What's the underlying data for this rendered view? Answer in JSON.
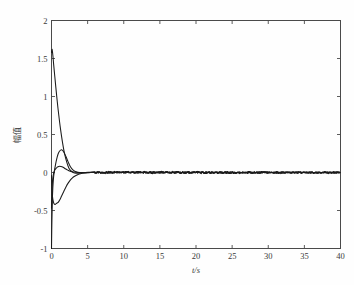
{
  "chart_data": {
    "type": "line",
    "title": "",
    "xlabel": "t/s",
    "ylabel": "幅值",
    "xlim": [
      0,
      40
    ],
    "ylim": [
      -1,
      2
    ],
    "xticks": [
      0,
      5,
      10,
      15,
      20,
      25,
      30,
      35,
      40
    ],
    "xticklabels": [
      "0",
      "5",
      "10",
      "15",
      "20",
      "25",
      "30",
      "35",
      "40"
    ],
    "yticks": [
      -1,
      -0.5,
      0,
      0.5,
      1,
      1.5,
      2
    ],
    "yticklabels": [
      "-1",
      "-0.5",
      "0",
      "0.5",
      "1",
      "1.5",
      "2"
    ],
    "grid": false,
    "legend": null,
    "line_color": "#1a1a1a",
    "background_color": "#fefefe",
    "axis_color": "#4a4a4a",
    "series": [
      {
        "name": "state-1",
        "comment": "starts near 1.6, decays steeply through zero by t~2.6, settles at 0 with small noise",
        "x": [
          0.0,
          0.08,
          0.18,
          0.3,
          0.45,
          0.6,
          0.8,
          1.0,
          1.25,
          1.5,
          1.8,
          2.1,
          2.4,
          2.7,
          3.0,
          3.4,
          3.8,
          4.3,
          5.0,
          6.0,
          8.0,
          10.0,
          12.0,
          15.0,
          18.0,
          21.0,
          24.0,
          27.0,
          30.0,
          33.0,
          36.0,
          38.0,
          40.0
        ],
        "y": [
          1.58,
          1.62,
          1.55,
          1.42,
          1.27,
          1.12,
          0.93,
          0.76,
          0.57,
          0.41,
          0.25,
          0.14,
          0.06,
          0.02,
          0.0,
          -0.01,
          -0.01,
          -0.005,
          0.0,
          0.004,
          -0.006,
          0.005,
          -0.004,
          0.006,
          -0.005,
          0.004,
          -0.006,
          0.005,
          -0.004,
          0.005,
          -0.005,
          0.004,
          0.0
        ]
      },
      {
        "name": "state-2",
        "comment": "starts at -1, rises quickly, overshoots to about +0.30 at t~1.4, returns to 0 by t~3.5",
        "x": [
          0.0,
          0.06,
          0.14,
          0.25,
          0.4,
          0.55,
          0.7,
          0.9,
          1.1,
          1.4,
          1.7,
          2.0,
          2.3,
          2.6,
          3.0,
          3.4,
          3.9,
          4.5,
          5.2,
          6.0,
          8.0,
          10.0,
          13.0,
          16.0,
          19.0,
          22.0,
          25.0,
          28.0,
          31.0,
          34.0,
          37.0,
          40.0
        ],
        "y": [
          -1.0,
          -0.62,
          -0.3,
          -0.1,
          0.02,
          0.1,
          0.17,
          0.24,
          0.28,
          0.3,
          0.27,
          0.21,
          0.14,
          0.08,
          0.03,
          0.01,
          0.0,
          0.0,
          -0.003,
          0.004,
          -0.005,
          0.006,
          -0.004,
          0.005,
          -0.006,
          0.004,
          -0.005,
          0.005,
          -0.004,
          0.005,
          -0.004,
          0.0
        ]
      },
      {
        "name": "state-3",
        "comment": "starts near -0.05, dips down to about -0.42 at t~0.9, recovers to 0 by t~4",
        "x": [
          0.0,
          0.05,
          0.12,
          0.22,
          0.35,
          0.5,
          0.65,
          0.8,
          0.95,
          1.15,
          1.4,
          1.7,
          2.0,
          2.3,
          2.6,
          2.9,
          3.2,
          3.6,
          4.0,
          4.6,
          5.4,
          6.5,
          8.0,
          10.0,
          13.0,
          16.0,
          19.0,
          22.0,
          25.0,
          28.0,
          31.0,
          34.0,
          37.0,
          40.0
        ],
        "y": [
          -0.04,
          -0.18,
          -0.3,
          -0.37,
          -0.41,
          -0.42,
          -0.41,
          -0.4,
          -0.39,
          -0.36,
          -0.31,
          -0.25,
          -0.19,
          -0.14,
          -0.1,
          -0.07,
          -0.05,
          -0.03,
          -0.015,
          -0.006,
          0.0,
          0.004,
          -0.005,
          0.005,
          -0.004,
          0.006,
          -0.005,
          0.004,
          -0.005,
          0.005,
          -0.004,
          0.004,
          -0.005,
          0.0
        ]
      },
      {
        "name": "state-4",
        "comment": "starts near -0.45, quick rise through 0, small bump, settles flat at 0",
        "x": [
          0.0,
          0.05,
          0.12,
          0.2,
          0.32,
          0.45,
          0.6,
          0.8,
          1.0,
          1.3,
          1.6,
          1.9,
          2.2,
          2.5,
          2.9,
          3.3,
          3.8,
          4.4,
          5.2,
          6.2,
          8.0,
          10.0,
          12.0,
          15.0,
          18.0,
          21.0,
          24.0,
          27.0,
          30.0,
          33.0,
          36.0,
          38.0,
          40.0
        ],
        "y": [
          -0.47,
          -0.28,
          -0.14,
          -0.06,
          0.0,
          0.03,
          0.05,
          0.07,
          0.08,
          0.08,
          0.07,
          0.05,
          0.035,
          0.02,
          0.01,
          0.005,
          0.0,
          0.0,
          0.003,
          -0.004,
          0.005,
          -0.005,
          0.004,
          -0.006,
          0.005,
          -0.004,
          0.006,
          -0.005,
          0.004,
          -0.005,
          0.005,
          -0.004,
          0.0
        ]
      }
    ]
  }
}
